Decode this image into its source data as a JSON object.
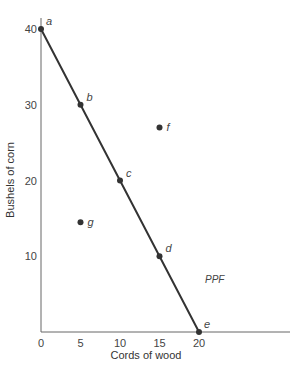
{
  "chart_data": {
    "type": "line",
    "title": "",
    "xlabel": "Cords of wood",
    "ylabel": "Bushels of corn",
    "xlim": [
      0,
      32
    ],
    "ylim": [
      0,
      42
    ],
    "xticks": [
      0,
      5,
      10,
      15,
      20
    ],
    "yticks": [
      10,
      20,
      30,
      40
    ],
    "grid": false,
    "series": [
      {
        "name": "PPF",
        "label": "PPF",
        "points": [
          {
            "label": "a",
            "x": 0,
            "y": 40
          },
          {
            "label": "b",
            "x": 5,
            "y": 30
          },
          {
            "label": "c",
            "x": 10,
            "y": 20
          },
          {
            "label": "d",
            "x": 15,
            "y": 10
          },
          {
            "label": "e",
            "x": 20,
            "y": 0
          }
        ]
      }
    ],
    "extra_points": [
      {
        "label": "f",
        "x": 15,
        "y": 27
      },
      {
        "label": "g",
        "x": 5,
        "y": 14.5
      }
    ],
    "colors": {
      "line": "#333333",
      "axis": "#555555",
      "text": "#444444"
    }
  }
}
